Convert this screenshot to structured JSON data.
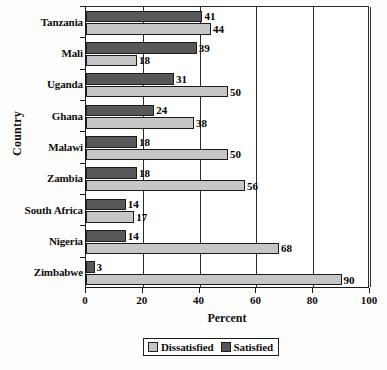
{
  "chart_data": {
    "type": "bar",
    "orientation": "horizontal",
    "title": "",
    "xlabel": "Percent",
    "ylabel": "Country",
    "categories": [
      "Tanzania",
      "Mali",
      "Uganda",
      "Ghana",
      "Malawi",
      "Zambia",
      "South Africa",
      "Nigeria",
      "Zimbabwe"
    ],
    "series": [
      {
        "name": "Dissatisfied",
        "color": "#c6c6c6",
        "values": [
          44,
          18,
          50,
          38,
          50,
          56,
          17,
          68,
          90
        ]
      },
      {
        "name": "Satisfied",
        "color": "#585858",
        "values": [
          41,
          39,
          31,
          24,
          18,
          18,
          14,
          14,
          3
        ]
      }
    ],
    "xlim": [
      0,
      100
    ],
    "xticks": [
      0,
      20,
      40,
      60,
      80,
      100
    ],
    "xtick_labels": [
      "0",
      "20",
      "40",
      "60",
      "80",
      "100"
    ],
    "grid": "vertical",
    "legend_position": "bottom-center"
  },
  "legend": {
    "items": [
      {
        "label": "Dissatisfied",
        "swatch": "dissatisfied"
      },
      {
        "label": "Satisfied",
        "swatch": "satisfied"
      }
    ]
  }
}
